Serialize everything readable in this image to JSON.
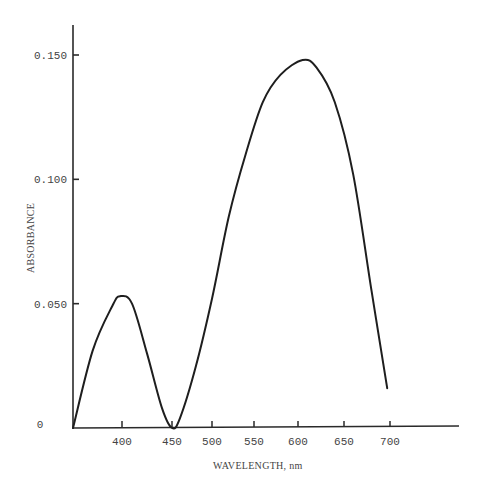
{
  "chart_data": {
    "type": "line",
    "title": "",
    "xlabel": "WAVELENGTH, nm",
    "ylabel": "ABSORBANCE",
    "x_ticks": [
      400,
      450,
      500,
      550,
      600,
      650,
      700
    ],
    "x_tick_labels": [
      "400",
      "450",
      "500",
      "550",
      "600",
      "650",
      "700"
    ],
    "y_ticks": [
      0,
      0.05,
      0.1,
      0.15
    ],
    "y_tick_labels": [
      "0",
      "0.050",
      "0.100",
      "0.150"
    ],
    "xlim": [
      350,
      780
    ],
    "ylim": [
      0,
      0.162
    ],
    "grid": false,
    "legend": null,
    "series": [
      {
        "name": "absorbance spectrum",
        "x": [
          350,
          370,
          390,
          398,
          410,
          425,
          440,
          450,
          460,
          480,
          500,
          520,
          540,
          560,
          580,
          605,
          620,
          640,
          660,
          680,
          697
        ],
        "values": [
          0.0,
          0.031,
          0.049,
          0.053,
          0.05,
          0.03,
          0.008,
          0.0,
          0.004,
          0.025,
          0.052,
          0.085,
          0.11,
          0.131,
          0.142,
          0.148,
          0.145,
          0.131,
          0.102,
          0.055,
          0.016
        ]
      }
    ],
    "annotations": {
      "local_max_1": {
        "x": 398,
        "y": 0.053
      },
      "local_min": {
        "x": 450,
        "y": 0.0
      },
      "global_max": {
        "x": 605,
        "y": 0.148
      }
    }
  },
  "colors": {
    "line": "#1e1e1e",
    "axis": "#2a2a2a",
    "text": "#444444",
    "background": "#ffffff"
  }
}
